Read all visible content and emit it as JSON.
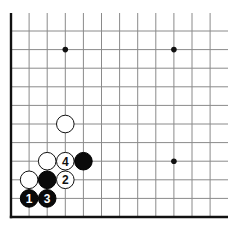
{
  "diagram": {
    "type": "go-board-corner",
    "board_area": "lower-left corner",
    "grid": {
      "origin_x": 11,
      "origin_y": 217,
      "spacing_x": 18.1,
      "spacing_y": 18.6,
      "columns": 12,
      "rows": 11,
      "line_color": "#8a8a8a",
      "edge_color": "#111111"
    },
    "star_points": [
      {
        "col": 3,
        "row": 9
      },
      {
        "col": 9,
        "row": 9
      },
      {
        "col": 9,
        "row": 3
      }
    ],
    "stones": [
      {
        "color": "black",
        "col": 1,
        "row": 1,
        "label": "1"
      },
      {
        "color": "black",
        "col": 2,
        "row": 1,
        "label": "3"
      },
      {
        "color": "white",
        "col": 1,
        "row": 2,
        "label": ""
      },
      {
        "color": "black",
        "col": 2,
        "row": 2,
        "label": ""
      },
      {
        "color": "white",
        "col": 3,
        "row": 2,
        "label": "2"
      },
      {
        "color": "white",
        "col": 2,
        "row": 3,
        "label": ""
      },
      {
        "color": "white",
        "col": 3,
        "row": 3,
        "label": "4"
      },
      {
        "color": "black",
        "col": 4,
        "row": 3,
        "label": ""
      },
      {
        "color": "white",
        "col": 3,
        "row": 5,
        "label": ""
      }
    ]
  }
}
